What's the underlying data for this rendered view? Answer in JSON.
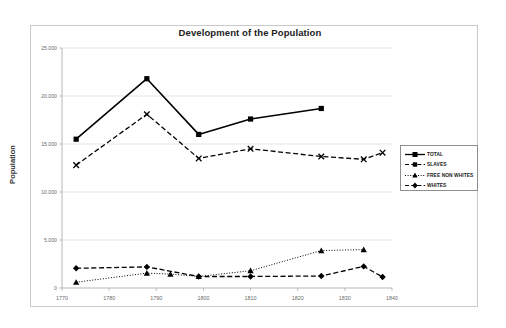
{
  "chart_data": {
    "type": "line",
    "title": "Development of the Population",
    "xlabel": "",
    "ylabel": "Population",
    "xlim": [
      1770,
      1840
    ],
    "ylim": [
      0,
      25000
    ],
    "xticks": [
      1770,
      1780,
      1790,
      1800,
      1810,
      1820,
      1830,
      1840
    ],
    "xtick_labels": [
      "1770",
      "1780",
      "1790",
      "1800",
      "1810",
      "1820",
      "1830",
      "1840"
    ],
    "yticks": [
      0,
      5000,
      10000,
      15000,
      20000,
      25000
    ],
    "ytick_labels": [
      "0",
      "5.000",
      "10.000",
      "15.000",
      "20.000",
      "25.000"
    ],
    "grid": "horizontal",
    "legend_position": "right",
    "series": [
      {
        "name": "TOTAL",
        "marker": "square",
        "line": "solid",
        "color": "#000000",
        "x": [
          1773,
          1788,
          1799,
          1810,
          1825
        ],
        "values": [
          15500,
          21800,
          16000,
          17600,
          18700
        ]
      },
      {
        "name": "SLAVES",
        "marker": "x",
        "line": "dashed",
        "color": "#000000",
        "x": [
          1773,
          1788,
          1799,
          1810,
          1825,
          1834,
          1838
        ],
        "values": [
          12800,
          18100,
          13500,
          14500,
          13700,
          13400,
          14100
        ]
      },
      {
        "name": "FREE NON WHITES",
        "marker": "triangle",
        "line": "dotted",
        "color": "#000000",
        "x": [
          1773,
          1788,
          1793,
          1799,
          1810,
          1825,
          1834
        ],
        "values": [
          600,
          1550,
          1450,
          1200,
          1800,
          3900,
          4000
        ]
      },
      {
        "name": "WHITES",
        "marker": "diamond",
        "line": "dashed",
        "color": "#000000",
        "x": [
          1773,
          1788,
          1799,
          1810,
          1825,
          1834,
          1838
        ],
        "values": [
          2050,
          2200,
          1200,
          1200,
          1250,
          2250,
          1150
        ]
      }
    ]
  },
  "legend": {
    "items": [
      {
        "label": "TOTAL"
      },
      {
        "label": "SLAVES"
      },
      {
        "label": "FREE NON WHITES"
      },
      {
        "label": "WHITES"
      }
    ]
  }
}
